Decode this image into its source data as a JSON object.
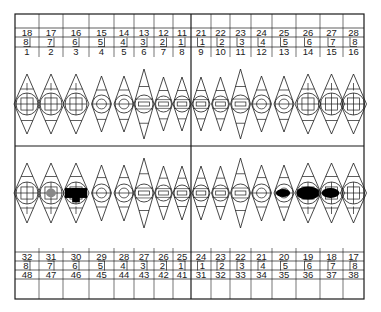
{
  "frame": {
    "left": 15,
    "top": 14,
    "right": 364,
    "bottom": 299,
    "midline_x": 191,
    "midline_y": 146
  },
  "colors": {
    "line": "#1a1a1a",
    "background": "#ffffff",
    "fill_marked": "#000000"
  },
  "columns": [
    {
      "x0": 15,
      "x1": 39
    },
    {
      "x0": 39,
      "x1": 63
    },
    {
      "x0": 63,
      "x1": 89
    },
    {
      "x0": 89,
      "x1": 114
    },
    {
      "x0": 114,
      "x1": 134
    },
    {
      "x0": 134,
      "x1": 154
    },
    {
      "x0": 154,
      "x1": 173
    },
    {
      "x0": 173,
      "x1": 191
    },
    {
      "x0": 191,
      "x1": 211
    },
    {
      "x0": 211,
      "x1": 230
    },
    {
      "x0": 230,
      "x1": 251
    },
    {
      "x0": 251,
      "x1": 272
    },
    {
      "x0": 272,
      "x1": 296
    },
    {
      "x0": 296,
      "x1": 320
    },
    {
      "x0": 320,
      "x1": 343
    },
    {
      "x0": 343,
      "x1": 364
    }
  ],
  "upper": {
    "fdi": [
      "18",
      "17",
      "16",
      "15",
      "14",
      "13",
      "12",
      "11",
      "21",
      "22",
      "23",
      "24",
      "25",
      "26",
      "27",
      "28"
    ],
    "palmer": [
      "8",
      "7",
      "6",
      "5",
      "4",
      "3",
      "2",
      "1",
      "1",
      "2",
      "3",
      "4",
      "5",
      "6",
      "7",
      "8"
    ],
    "palmer_side": [
      "R",
      "R",
      "R",
      "R",
      "R",
      "R",
      "R",
      "R",
      "L",
      "L",
      "L",
      "L",
      "L",
      "L",
      "L",
      "L"
    ],
    "universal": [
      "1",
      "2",
      "3",
      "4",
      "5",
      "6",
      "7",
      "8",
      "9",
      "10",
      "11",
      "12",
      "13",
      "14",
      "15",
      "16"
    ],
    "teeth": [
      {
        "type": "molar",
        "marked": ""
      },
      {
        "type": "molar",
        "marked": ""
      },
      {
        "type": "molar",
        "marked": ""
      },
      {
        "type": "premolar",
        "marked": ""
      },
      {
        "type": "premolar",
        "marked": ""
      },
      {
        "type": "canine",
        "marked": ""
      },
      {
        "type": "incisor",
        "marked": ""
      },
      {
        "type": "incisor",
        "marked": ""
      },
      {
        "type": "incisor",
        "marked": ""
      },
      {
        "type": "incisor",
        "marked": ""
      },
      {
        "type": "canine",
        "marked": ""
      },
      {
        "type": "premolar",
        "marked": ""
      },
      {
        "type": "premolar",
        "marked": ""
      },
      {
        "type": "molar",
        "marked": ""
      },
      {
        "type": "molar",
        "marked": ""
      },
      {
        "type": "molar",
        "marked": ""
      }
    ]
  },
  "lower": {
    "universal": [
      "32",
      "31",
      "30",
      "29",
      "28",
      "27",
      "26",
      "25",
      "24",
      "23",
      "22",
      "21",
      "20",
      "19",
      "18",
      "17"
    ],
    "palmer": [
      "8",
      "7",
      "6",
      "5",
      "4",
      "3",
      "2",
      "1",
      "1",
      "2",
      "3",
      "4",
      "5",
      "6",
      "7",
      "8"
    ],
    "palmer_side": [
      "R",
      "R",
      "R",
      "R",
      "R",
      "R",
      "R",
      "R",
      "L",
      "L",
      "L",
      "L",
      "L",
      "L",
      "L",
      "L"
    ],
    "fdi": [
      "48",
      "47",
      "46",
      "45",
      "44",
      "43",
      "42",
      "41",
      "31",
      "32",
      "33",
      "34",
      "35",
      "36",
      "37",
      "38"
    ],
    "teeth": [
      {
        "type": "molar",
        "marked": ""
      },
      {
        "type": "molar",
        "marked": "light"
      },
      {
        "type": "molar",
        "marked": "full"
      },
      {
        "type": "premolar",
        "marked": ""
      },
      {
        "type": "premolar",
        "marked": ""
      },
      {
        "type": "canine",
        "marked": ""
      },
      {
        "type": "incisor",
        "marked": ""
      },
      {
        "type": "incisor",
        "marked": ""
      },
      {
        "type": "incisor",
        "marked": ""
      },
      {
        "type": "incisor",
        "marked": ""
      },
      {
        "type": "canine",
        "marked": ""
      },
      {
        "type": "premolar",
        "marked": ""
      },
      {
        "type": "premolar",
        "marked": "occlusal"
      },
      {
        "type": "molar",
        "marked": "occlusal-wide"
      },
      {
        "type": "molar",
        "marked": "occlusal"
      },
      {
        "type": "molar",
        "marked": ""
      }
    ]
  }
}
